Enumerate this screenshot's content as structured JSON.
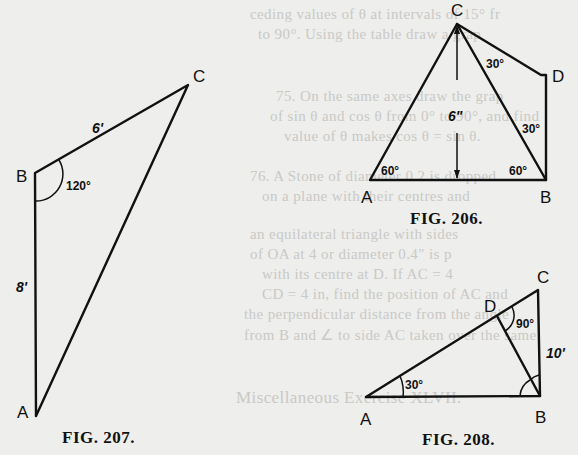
{
  "background_text": [
    "ceding values of θ at intervals of 15° fr",
    "to 90°. Using the table draw a grap",
    "75. On the same axes draw the grap",
    "of sin θ and cos θ from 0° to 90°, and find",
    "value of θ makes cos θ = sin θ.",
    "76. A Stone of diameter 0.2 is dropped",
    "on a plane with their centres and",
    "an equilateral triangle with sides",
    "of OA at 4 or diameter 0.4\" is p",
    "with its centre at D. If AC = 4",
    "CD = 4 in, find the position of AC and",
    "the perpendicular distance from the angle",
    "from B and ∠ to side AC taken over the same",
    "Miscellaneous Exercise XLVII."
  ],
  "figures": {
    "fig207": {
      "caption": "FIG. 207.",
      "vertices": {
        "A": "A",
        "B": "B",
        "C": "C"
      },
      "side_BC": "6'",
      "side_AB": "8'",
      "angle_B": "120°"
    },
    "fig206": {
      "caption": "FIG. 206.",
      "vertices": {
        "A": "A",
        "B": "B",
        "C": "C",
        "D": "D"
      },
      "height": "6\"",
      "angle_DCB": "30°",
      "angle_DBC": "30°",
      "angle_A": "60°",
      "angle_B": "60°"
    },
    "fig208": {
      "caption": "FIG. 208.",
      "vertices": {
        "A": "A",
        "B": "B",
        "C": "C",
        "D": "D"
      },
      "angle_A": "30°",
      "angle_D": "90°",
      "side_BC": "10'"
    }
  }
}
